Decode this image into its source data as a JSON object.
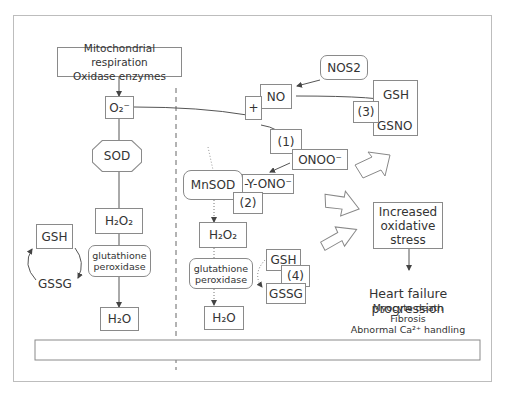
{
  "diagram": {
    "source_box": {
      "line1": "Mitochondrial respiration",
      "line2": "Oxidase enzymes"
    },
    "left_path": {
      "superoxide": "O₂⁻",
      "sod": "SOD",
      "h2o2": "H₂O₂",
      "enzyme_line1": "glutathione",
      "enzyme_line2": "peroxidase",
      "h2o": "H₂O",
      "gsh": "GSH",
      "gssg": "GSSG"
    },
    "right_path": {
      "nos2": "NOS2",
      "no": "NO",
      "plus": "+",
      "step1": "(1)",
      "onoo": "ONOO⁻",
      "mnsod": "MnSOD",
      "yono": "-Y-ONO⁻",
      "step2": "(2)",
      "h2o2": "H₂O₂",
      "enzyme_line1": "glutathione",
      "enzyme_line2": "peroxidase",
      "gsh": "GSH",
      "step4": "(4)",
      "gssg": "GSSG",
      "h2o": "H₂O",
      "gsh_top": "GSH",
      "step3": "(3)",
      "gsno": "GSNO"
    },
    "outcome": {
      "stress_line1": "Increased",
      "stress_line2": "oxidative",
      "stress_line3": "stress",
      "title": "Heart failure progression",
      "item1": "Myocyte death",
      "item2": "Fibrosis",
      "item3": "Abnormal Ca²⁺ handling"
    },
    "colors": {
      "line": "#555555",
      "border": "#8a8a8a",
      "text": "#333333"
    }
  }
}
